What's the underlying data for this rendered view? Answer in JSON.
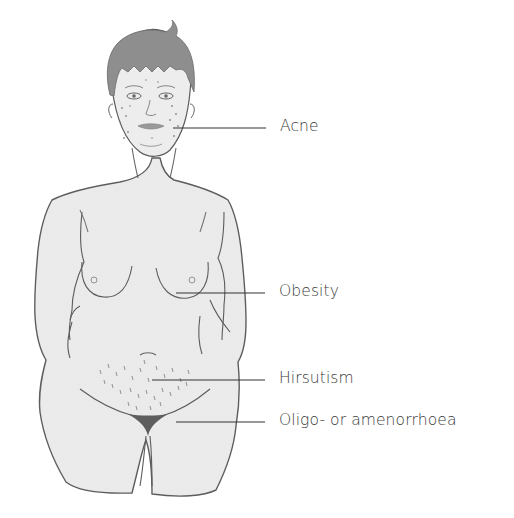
{
  "diagram": {
    "labels": [
      {
        "id": "acne",
        "text": "Acne",
        "x": 280,
        "y": 119,
        "line": {
          "x1": 173,
          "x2": 266,
          "y": 128
        }
      },
      {
        "id": "obesity",
        "text": "Obesity",
        "x": 279,
        "y": 284,
        "line": {
          "x1": 176,
          "x2": 265,
          "y": 293
        }
      },
      {
        "id": "hirsutism",
        "text": "Hirsutism",
        "x": 279,
        "y": 371,
        "line": {
          "x1": 152,
          "x2": 265,
          "y": 380
        }
      },
      {
        "id": "oligo",
        "text": "Oligo- or amenorrhoea",
        "x": 279,
        "y": 413,
        "line": {
          "x1": 176,
          "x2": 265,
          "y": 422
        }
      }
    ],
    "colors": {
      "skin_fill": "#ececec",
      "outline": "#555555",
      "hair": "#8a8a8a",
      "leader_line": "#333333",
      "label_text": "#3a3a3a"
    }
  }
}
